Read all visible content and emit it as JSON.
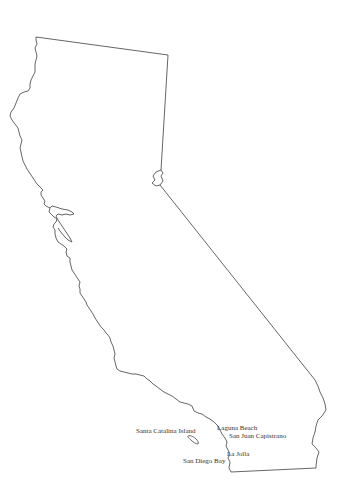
{
  "map": {
    "region": "California",
    "outline_color": "#555555",
    "background": "#ffffff",
    "labels": [
      {
        "text": "Santa Catalina Island",
        "x": 136,
        "y": 428
      },
      {
        "text": "Laguna Beach",
        "x": 217,
        "y": 425
      },
      {
        "text": "San Juan Capistrano",
        "x": 229,
        "y": 433
      },
      {
        "text": "La Jolla",
        "x": 227,
        "y": 451
      },
      {
        "text": "San Diego Bay",
        "x": 183,
        "y": 458
      }
    ]
  }
}
